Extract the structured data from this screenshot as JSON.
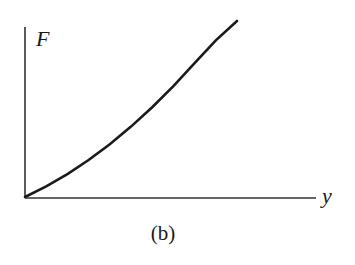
{
  "chart_data": {
    "type": "line",
    "title": "",
    "caption": "(b)",
    "xlabel": "y",
    "ylabel": "F",
    "grid": false,
    "legend": null,
    "ticks": {
      "x": [],
      "y": []
    },
    "series": [
      {
        "name": "F vs y",
        "shape": "concave-up increasing curve from origin",
        "x": [
          0,
          0.1,
          0.2,
          0.3,
          0.4,
          0.5,
          0.6,
          0.7,
          0.8,
          0.9,
          1.0
        ],
        "y": [
          0,
          0.06,
          0.13,
          0.21,
          0.3,
          0.4,
          0.51,
          0.63,
          0.76,
          0.89,
          1.0
        ]
      }
    ],
    "xlim": [
      0,
      1.4
    ],
    "ylim": [
      0,
      1.05
    ]
  },
  "colors": {
    "line": "#1a1a1a",
    "axis": "#333333"
  }
}
